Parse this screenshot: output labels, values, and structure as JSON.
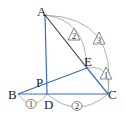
{
  "diagram": {
    "type": "geometry-triangle",
    "points": {
      "A": {
        "label": "A",
        "x": 45,
        "y": 15
      },
      "B": {
        "label": "B",
        "x": 18,
        "y": 94
      },
      "C": {
        "label": "C",
        "x": 108,
        "y": 94
      },
      "D": {
        "label": "D",
        "x": 47,
        "y": 94
      },
      "E": {
        "label": "E",
        "x": 87,
        "y": 68
      },
      "P": {
        "label": "P",
        "x": 47,
        "y": 82
      }
    },
    "segments": [
      {
        "from": "A",
        "to": "D",
        "color": "#3a6fb5"
      },
      {
        "from": "B",
        "to": "C",
        "color": "#3a6fb5"
      },
      {
        "from": "B",
        "to": "E",
        "color": "#3a6fb5"
      },
      {
        "from": "A",
        "to": "E",
        "color": "#33384a"
      },
      {
        "from": "E",
        "to": "C",
        "color": "#3a6fb5"
      }
    ],
    "ratio_marks": {
      "AE": {
        "label": "2",
        "shape": "triangle"
      },
      "AC": {
        "label": "3",
        "shape": "triangle"
      },
      "EC": {
        "label": "1",
        "shape": "triangle"
      },
      "BD": {
        "label": "1",
        "shape": "circle"
      },
      "DC": {
        "label": "2",
        "shape": "circle"
      }
    },
    "colors": {
      "blue_line": "#3a6fb5",
      "dark_line": "#33384a",
      "arc": "#9a9a9a"
    }
  }
}
